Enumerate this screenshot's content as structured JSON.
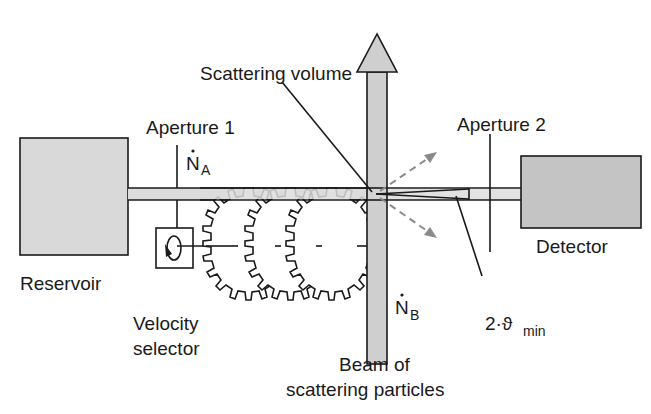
{
  "diagram": {
    "colors": {
      "reservoir_fill": "#d9d9d9",
      "detector_fill": "#c4c4c4",
      "beam_fill": "#dcdcdc",
      "vertical_beam_fill": "#cfcfcf",
      "line": "#1a1a1a",
      "scattered_arrow": "#8a8a8a"
    },
    "labels": {
      "reservoir": "Reservoir",
      "aperture1": "Aperture 1",
      "aperture2": "Aperture 2",
      "flux_a": "N",
      "flux_a_sub": "A",
      "flux_b": "N",
      "flux_b_sub": "B",
      "scattering_volume": "Scattering volume",
      "detector": "Detector",
      "velocity_selector_line1": "Velocity",
      "velocity_selector_line2": "selector",
      "beam_line1": "Beam of",
      "beam_line2": "scattering particles",
      "angle_prefix": "2·ϑ",
      "angle_sub": "min"
    }
  }
}
